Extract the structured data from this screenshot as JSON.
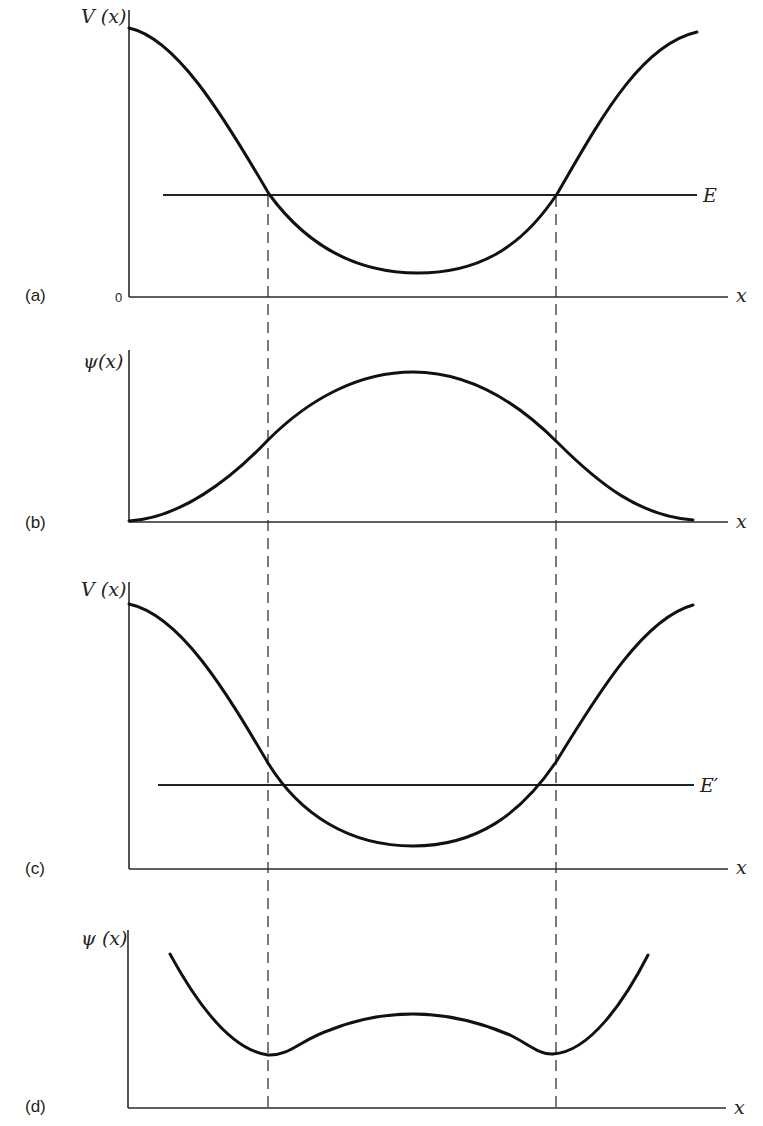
{
  "figure": {
    "panels": [
      {
        "id": "a",
        "label": "(a)",
        "y_label": "V (x)",
        "x_label": "x",
        "origin_label": "0",
        "level_label": "E",
        "description": "Potential well V(x) with energy level E; classical turning points where E meets V(x)"
      },
      {
        "id": "b",
        "label": "(b)",
        "y_label": "ψ(x)",
        "x_label": "x",
        "description": "Wavefunction for energy E: single smooth hump, decaying to zero at edges"
      },
      {
        "id": "c",
        "label": "(c)",
        "y_label": "V (x)",
        "x_label": "x",
        "level_label": "E′",
        "description": "Same potential with a lower energy level E′; turning points move inward"
      },
      {
        "id": "d",
        "label": "(d)",
        "y_label": "ψ (x)",
        "x_label": "x",
        "description": "Wavefunction for E′: diverges outward beyond the original turning points, with dips at the dashed lines"
      }
    ],
    "guides": {
      "style": "dashed vertical lines",
      "count": 2,
      "meaning": "Classical turning points for energy E, carried down through all panels"
    },
    "colors": {
      "ink": "#111111",
      "axis": "#2a2a2a",
      "background": "#ffffff"
    }
  }
}
